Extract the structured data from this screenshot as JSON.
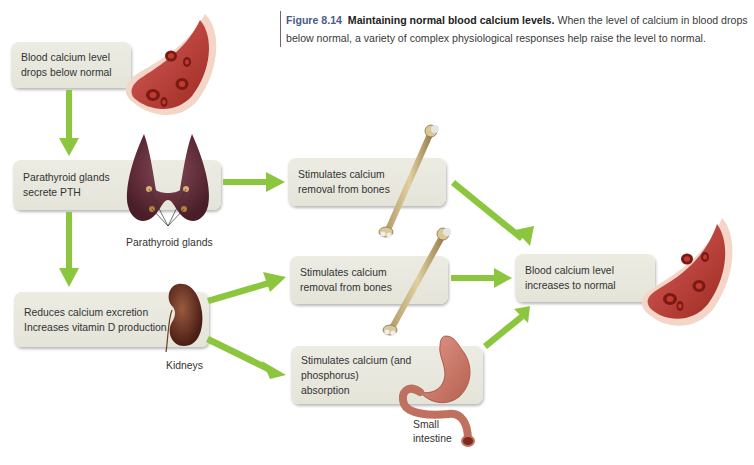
{
  "caption": {
    "figure_number": "Figure 8.14",
    "title": "Maintaining normal blood calcium levels.",
    "text": "When the level of calcium in blood drops below normal, a variety of complex physiological responses help raise the level to normal."
  },
  "nodes": {
    "start": {
      "line1": "Blood calcium level",
      "line2": "drops below normal"
    },
    "parathyroid": {
      "line1": "Parathyroid glands",
      "line2": "secrete PTH"
    },
    "kidney_effect": {
      "line1": "Reduces calcium excretion",
      "line2": "Increases vitamin D production"
    },
    "bone_removal_1": {
      "line1": "Stimulates calcium",
      "line2": "removal from bones"
    },
    "bone_removal_2": {
      "line1": "Stimulates calcium",
      "line2": "removal from bones"
    },
    "absorption": {
      "line1": "Stimulates calcium (and",
      "line2": "phosphorus)",
      "line3": "absorption"
    },
    "end": {
      "line1": "Blood calcium level",
      "line2": "increases to normal"
    }
  },
  "labels": {
    "parathyroid_glands": "Parathyroid glands",
    "kidneys": "Kidneys",
    "small_intestine_1": "Small",
    "small_intestine_2": "intestine"
  },
  "illustrations": {
    "blood_vessel_top": "blood-vessel-icon",
    "thyroid": "thyroid-parathyroid-icon",
    "kidney": "kidney-icon",
    "bone_1": "bone-icon",
    "bone_2": "bone-icon",
    "stomach_intestine": "stomach-intestine-icon",
    "blood_vessel_end": "blood-vessel-icon"
  },
  "edges": [
    {
      "from": "start",
      "to": "parathyroid"
    },
    {
      "from": "parathyroid",
      "to": "kidney_effect"
    },
    {
      "from": "parathyroid",
      "to": "bone_removal_1"
    },
    {
      "from": "kidney_effect",
      "to": "bone_removal_2"
    },
    {
      "from": "kidney_effect",
      "to": "absorption"
    },
    {
      "from": "bone_removal_1",
      "to": "end"
    },
    {
      "from": "bone_removal_2",
      "to": "end"
    },
    {
      "from": "absorption",
      "to": "end"
    }
  ],
  "colors": {
    "arrow": "#8cc63f",
    "box": "#e8e8de",
    "blood": "#b5342a",
    "figure_number": "#4a5a8c"
  }
}
